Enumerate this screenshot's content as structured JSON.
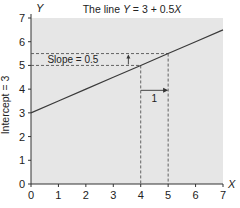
{
  "chart_data": {
    "type": "line",
    "title": "The line Y = 3 + 0.5X",
    "xlabel": "X",
    "ylabel": "Y",
    "xlim": [
      0,
      7
    ],
    "ylim": [
      0,
      7
    ],
    "x_ticks": [
      "0",
      "1",
      "2",
      "3",
      "4",
      "5",
      "6",
      "7"
    ],
    "y_ticks": [
      "0",
      "1",
      "2",
      "3",
      "4",
      "5",
      "6",
      "7"
    ],
    "grid": false,
    "legend": null,
    "series": [
      {
        "name": "Y = 3 + 0.5X",
        "x": [
          0,
          1,
          2,
          3,
          4,
          5,
          6,
          7
        ],
        "values": [
          3,
          3.5,
          4,
          4.5,
          5,
          5.5,
          6,
          6.5
        ]
      }
    ],
    "annotations": [
      {
        "type": "side-label",
        "text": "Intercept = 3",
        "axis": "y",
        "at": 3
      },
      {
        "type": "label",
        "text": "Slope = 0.5",
        "x_range": [
          0,
          4
        ],
        "y_range": [
          5,
          5.5
        ]
      },
      {
        "type": "arrow",
        "text": "1",
        "from": [
          4,
          3.95
        ],
        "to": [
          5,
          3.95
        ]
      },
      {
        "type": "dashed-guide",
        "x": 4,
        "y": 5
      },
      {
        "type": "dashed-guide",
        "x": 5,
        "y": 5.5
      }
    ]
  },
  "labels": {
    "title_prefix": "The line ",
    "title_y": "Y",
    "title_eq": " = 3 + 0.5",
    "title_x": "X",
    "x_axis": "X",
    "y_axis": "Y",
    "intercept": "Intercept = 3",
    "slope": "Slope = 0.5",
    "run": "1"
  },
  "colors": {
    "plot_bg": "#e6e6e6",
    "line": "#3a3a3a",
    "axis": "#333333",
    "dashed": "#555555"
  }
}
